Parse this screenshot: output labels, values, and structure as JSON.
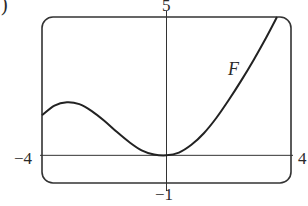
{
  "figure": {
    "part_marker": ")",
    "labels": {
      "x_min": "−4",
      "x_max": "4",
      "y_max": "5",
      "y_min": "−1",
      "curve": "F"
    },
    "colors": {
      "line": "#222222",
      "frame": "#333333",
      "background": "#ffffff"
    }
  },
  "chart_data": {
    "type": "line",
    "title": "",
    "xlabel": "",
    "ylabel": "",
    "xlim": [
      -4,
      4
    ],
    "ylim": [
      -1,
      5
    ],
    "grid": false,
    "legend": null,
    "window_labels": {
      "x_min": "−4",
      "x_max": "4",
      "y_min": "−1",
      "y_max": "5"
    },
    "annotations": [
      {
        "text": "F",
        "x": 2.1,
        "y": 3.4,
        "italic": true
      }
    ],
    "series": [
      {
        "name": "F",
        "x": [
          -4.0,
          -3.6,
          -3.2,
          -2.8,
          -2.4,
          -2.0,
          -1.6,
          -1.2,
          -0.8,
          -0.4,
          0.0,
          0.4,
          0.8,
          1.2,
          1.6,
          2.0,
          2.4,
          2.8,
          3.2,
          3.55
        ],
        "y": [
          1.45,
          1.8,
          1.92,
          1.85,
          1.6,
          1.25,
          0.85,
          0.48,
          0.18,
          0.03,
          0.0,
          0.1,
          0.38,
          0.8,
          1.35,
          2.0,
          2.7,
          3.45,
          4.25,
          5.0
        ]
      }
    ]
  }
}
